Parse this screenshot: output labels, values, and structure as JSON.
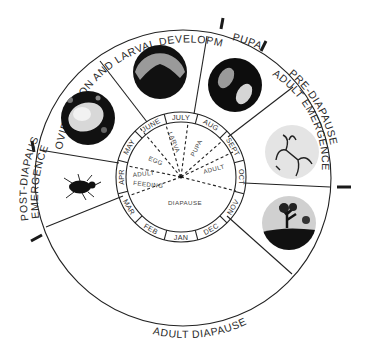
{
  "diagram": {
    "outer_phases": [
      {
        "id": "oviposition-larval-development",
        "label": "OVIPOSITION AND LARVAL DEVELOPMENT"
      },
      {
        "id": "pupa",
        "label": "PUPA"
      },
      {
        "id": "pre-diapause-line1",
        "label": "PRE-DIAPAUSE"
      },
      {
        "id": "pre-diapause-line2",
        "label": "ADULT EMERGENCE"
      },
      {
        "id": "adult-diapause",
        "label": "ADULT DIAPAUSE"
      },
      {
        "id": "post-diapause-line1",
        "label": "POST-DIAPAUSE"
      },
      {
        "id": "post-diapause-line2",
        "label": "EMERGENCE"
      }
    ],
    "months": [
      "JAN",
      "FEB",
      "MAR",
      "APR",
      "MAY",
      "JUNE",
      "JULY",
      "AUG",
      "SEPT",
      "OCT",
      "NOV",
      "DEC"
    ],
    "inner_stages": {
      "egg": "EGG",
      "larva": "LARVA",
      "pupa": "PUPA",
      "adult": "ADULT",
      "adult_feeding_1": "ADULT",
      "adult_feeding_2": "FEEDING",
      "diapause": "DIAPAUSE"
    },
    "photos": [
      {
        "id": "egg-in-bud",
        "subject": "egg photo"
      },
      {
        "id": "larva",
        "subject": "larva in fruit photo"
      },
      {
        "id": "pupae",
        "subject": "pupae photo"
      },
      {
        "id": "emerging-adult",
        "subject": "plant sketch photo"
      },
      {
        "id": "diapause-habitat",
        "subject": "tree silhouette photo"
      },
      {
        "id": "adult-weevil",
        "subject": "weevil icon"
      }
    ],
    "colors": {
      "ink": "#222222",
      "photo_dark": "#111111",
      "photo_light": "#cfcfcf"
    }
  }
}
